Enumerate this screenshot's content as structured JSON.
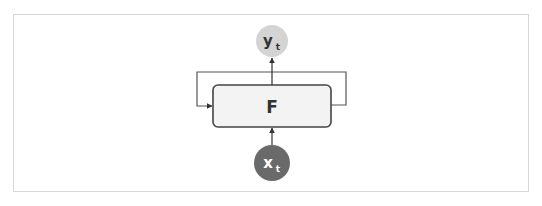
{
  "diagram": {
    "nodes": {
      "output": {
        "label": "y",
        "subscript": "t",
        "fill": "#d4d4d4",
        "text_color": "#333333"
      },
      "function": {
        "label": "F",
        "fill": "#f3f3f3",
        "stroke": "#444444"
      },
      "input": {
        "label": "x",
        "subscript": "t",
        "fill": "#6a6a6a",
        "text_color": "#ffffff"
      }
    },
    "edges": [
      {
        "from": "input",
        "to": "function"
      },
      {
        "from": "function",
        "to": "output"
      },
      {
        "from": "function",
        "to": "function",
        "type": "recurrent-loop"
      }
    ],
    "colors": {
      "frame": "#d6d6d6",
      "line": "#444444"
    }
  }
}
